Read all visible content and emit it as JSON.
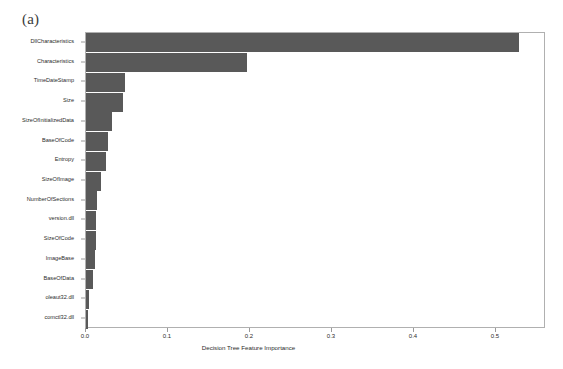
{
  "figure": {
    "panel_label": "(a)",
    "background_color": "#ffffff",
    "bar_color": "#595959",
    "frame_color": "#b0b0b0"
  },
  "chart_data": {
    "type": "bar",
    "orientation": "horizontal",
    "title": "",
    "subtitle": "",
    "xlabel": "Decision Tree Feature Importance",
    "ylabel": "",
    "xlim": [
      0.0,
      0.561
    ],
    "xticks": [
      0.0,
      0.1,
      0.2,
      0.3,
      0.4,
      0.5
    ],
    "xtick_labels": [
      "0.0",
      "0.1",
      "0.2",
      "0.3",
      "0.4",
      "0.5"
    ],
    "grid": false,
    "legend": null,
    "categories": [
      "DllCharacteristics",
      "Characteristics",
      "TimeDateStamp",
      "Size",
      "SizeOfInitializedData",
      "BaseOfCode",
      "Entropy",
      "SizeOfImage",
      "NumberOfSections",
      "version.dll",
      "SizeOfCode",
      "ImageBase",
      "BaseOfData",
      "oleaut32.dll",
      "comctl32.dll"
    ],
    "values": [
      0.528,
      0.196,
      0.047,
      0.045,
      0.032,
      0.027,
      0.024,
      0.018,
      0.013,
      0.012,
      0.012,
      0.011,
      0.008,
      0.004,
      0.003
    ],
    "series": [
      {
        "name": "Decision Tree Feature Importance",
        "values": [
          0.528,
          0.196,
          0.047,
          0.045,
          0.032,
          0.027,
          0.024,
          0.018,
          0.013,
          0.012,
          0.012,
          0.011,
          0.008,
          0.004,
          0.003
        ]
      }
    ]
  }
}
